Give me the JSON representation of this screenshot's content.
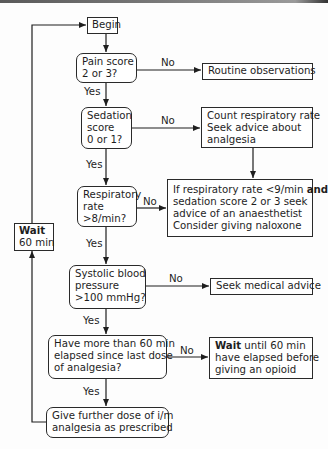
{
  "nodes": {
    "begin": "Begin",
    "pain": [
      "Pain score",
      "2 or 3?"
    ],
    "routine": "Routine observations",
    "sedation": [
      "Sedation",
      "score",
      "0 or 1?"
    ],
    "count": [
      "Count respiratory rate",
      "Seek advice about",
      "analgesia"
    ],
    "resp": [
      "Respiratory",
      "rate",
      ">8/min?"
    ],
    "ifresp": {
      "line1_pre": "If respiratory rate <9/min ",
      "line1_bold": "and",
      "line2": "sedation score 2 or 3 seek",
      "line3": "advice of an anaesthetist",
      "line4": "Consider giving naloxone"
    },
    "wait_loop": {
      "bold": "Wait",
      "text": "60 min"
    },
    "systolic": [
      "Systolic blood",
      "pressure",
      ">100 mmHg?"
    ],
    "seek_medical": "Seek medical advice",
    "elapsed": [
      "Have more than 60 min",
      "elapsed since last dose",
      "of analgesia?"
    ],
    "wait_until": {
      "bold": "Wait",
      "line1_rest": " until 60 min",
      "line2": "have elapsed before",
      "line3": "giving an opioid"
    },
    "give": [
      "Give further dose of i/m",
      "analgesia as prescribed"
    ]
  },
  "edge_labels": {
    "pain_no": "No",
    "pain_yes": "Yes",
    "sedation_no": "No",
    "sedation_yes": "Yes",
    "resp_no": "No",
    "resp_yes": "Yes",
    "systolic_no": "No",
    "systolic_yes": "Yes",
    "elapsed_no": "No",
    "elapsed_yes": "Yes"
  }
}
